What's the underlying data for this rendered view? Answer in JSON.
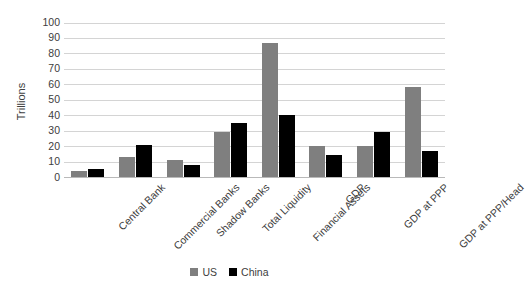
{
  "chart_data": {
    "type": "bar",
    "title": "",
    "xlabel": "",
    "ylabel": "Trillions",
    "ylim": [
      0,
      100
    ],
    "ytick_step": 10,
    "yticks": [
      "100",
      "90",
      "80",
      "70",
      "60",
      "50",
      "40",
      "30",
      "20",
      "10",
      "0"
    ],
    "grid": true,
    "legend_position": "bottom",
    "categories": [
      "Central Bank",
      "Commercial Banks",
      "Shadow Banks",
      "Total Liquidity",
      "Financial Assets",
      "GDP",
      "GDP at PPP",
      "GDP at PPP/Head"
    ],
    "series": [
      {
        "name": "US",
        "color": "#7f7f7f",
        "values": [
          4,
          13,
          11,
          29,
          87,
          20,
          20,
          58
        ]
      },
      {
        "name": "China",
        "color": "#000000",
        "values": [
          5,
          21,
          8,
          35,
          40,
          14,
          29,
          17
        ]
      }
    ]
  },
  "legend": {
    "items": [
      {
        "label": "US",
        "color": "#7f7f7f"
      },
      {
        "label": "China",
        "color": "#000000"
      }
    ]
  }
}
